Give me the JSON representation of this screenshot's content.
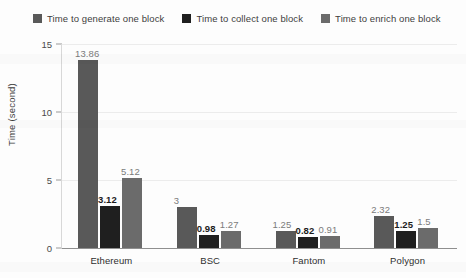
{
  "chart_data": {
    "type": "bar",
    "title": "",
    "xlabel": "",
    "ylabel": "Time (second)",
    "categories": [
      "Ethereum",
      "BSC",
      "Fantom",
      "Polygon"
    ],
    "series": [
      {
        "name": "Time to generate one block",
        "color": "#595959",
        "values": [
          13.86,
          3,
          1.25,
          2.32
        ],
        "labels": [
          "13.86",
          "3",
          "1.25",
          "2.32"
        ]
      },
      {
        "name": "Time to collect one block",
        "color": "#1f1f1f",
        "values": [
          3.12,
          0.98,
          0.82,
          1.25
        ],
        "labels": [
          "3.12",
          "0.98",
          "0.82",
          "1.25"
        ]
      },
      {
        "name": "Time to enrich one block",
        "color": "#6b6b6b",
        "values": [
          5.12,
          1.27,
          0.91,
          1.5
        ],
        "labels": [
          "5.12",
          "1.27",
          "0.91",
          "1.5"
        ]
      }
    ],
    "ylim": [
      0,
      15
    ],
    "yticks": [
      0,
      5,
      10,
      15
    ],
    "ytick_labels": [
      "0",
      "5",
      "10",
      "15"
    ],
    "grid": true,
    "legend_position": "top"
  },
  "legend": {
    "items": [
      {
        "label": "Time to generate one block",
        "color": "#595959"
      },
      {
        "label": "Time to collect one block",
        "color": "#1f1f1f"
      },
      {
        "label": "Time to enrich one block",
        "color": "#6b6b6b"
      }
    ]
  }
}
